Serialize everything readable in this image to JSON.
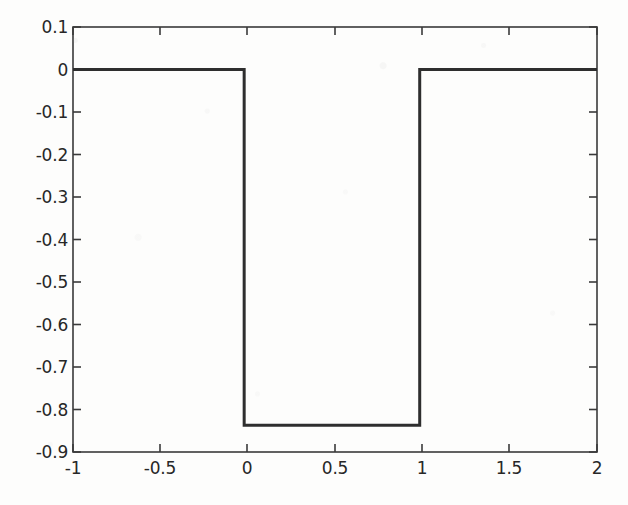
{
  "figure": {
    "background_color": "#fdfdfc",
    "line_color": "#2e2e2e",
    "axis_color": "#3a3a3a",
    "line_width_px": 3,
    "axis_width_px": 1.6
  },
  "chart_data": {
    "type": "line",
    "title": "",
    "xlabel": "",
    "ylabel": "",
    "xlim": [
      -1,
      2
    ],
    "ylim": [
      -0.9,
      0.1
    ],
    "grid": false,
    "legend": null,
    "box": true,
    "tick_direction": "in",
    "xticks": [
      -1,
      -0.5,
      0,
      0.5,
      1,
      1.5,
      2
    ],
    "xtick_labels": [
      "-1",
      "-0.5",
      "0",
      "0.5",
      "1",
      "1.5",
      "2"
    ],
    "yticks": [
      0.1,
      0,
      -0.1,
      -0.2,
      -0.3,
      -0.4,
      -0.5,
      -0.6,
      -0.7,
      -0.8,
      -0.9
    ],
    "ytick_labels": [
      "0.1",
      "0",
      "-0.1",
      "-0.2",
      "-0.3",
      "-0.4",
      "-0.5",
      "-0.6",
      "-0.7",
      "-0.8",
      "-0.9"
    ],
    "series": [
      {
        "name": "square-pulse",
        "low_value": -0.837,
        "high_value": 0,
        "pulse_start_x": -0.02,
        "pulse_end_x": 0.985,
        "x": [
          -1,
          -0.02,
          -0.02,
          0.985,
          0.985,
          2
        ],
        "y": [
          0,
          0,
          -0.837,
          -0.837,
          0,
          0
        ]
      }
    ]
  }
}
